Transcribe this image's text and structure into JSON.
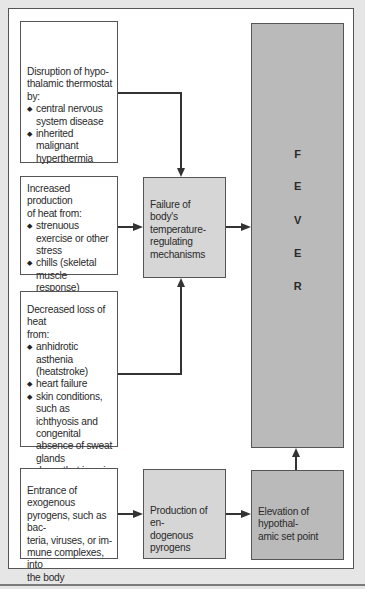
{
  "diagram": {
    "causes": [
      {
        "heading": "Disruption of hypo-thalamic thermostat by:",
        "heading_lines": [
          "Disruption of hypo-",
          "thalamic thermostat by:"
        ],
        "items": [
          "central nervous system disease",
          "inherited malignant hyperthermia"
        ]
      },
      {
        "heading": "Increased production of heat from:",
        "heading_lines": [
          "Increased production",
          "of heat from:"
        ],
        "items": [
          "strenuous exercise or other stress",
          "chills (skeletal muscle response)",
          "thyrotoxicosis"
        ]
      },
      {
        "heading": "Decreased loss of heat from:",
        "heading_lines": [
          "Decreased loss of heat",
          "from:"
        ],
        "items": [
          "anhidrotic asthenia (heatstroke)",
          "heart failure",
          "skin conditions, such as ichthyosis and congenital absence of sweat glands",
          "drugs that impair sweating"
        ]
      }
    ],
    "failure_box": "Failure of body's temperature-regulating mechanisms",
    "failure_lines": [
      "Failure of",
      "body's",
      "temperature-",
      "regulating",
      "mechanisms"
    ],
    "pyrogen_source": "Entrance of exogenous pyrogens, such as bacteria, viruses, or immune complexes, into the body",
    "pyrogen_source_lines": [
      "Entrance of exogenous",
      "pyrogens, such as bac-",
      "teria, viruses, or im-",
      "mune complexes, into",
      "the body"
    ],
    "production_box": "Production of endogenous pyrogens",
    "production_lines": [
      "Production of en-",
      "dogenous pyrogens"
    ],
    "elevation_box": "Elevation of hypothalamic set point",
    "elevation_lines": [
      "Elevation of hypothal-",
      "amic set point"
    ],
    "outcome": "FEVER",
    "outcome_letters": [
      "F",
      "E",
      "V",
      "E",
      "R"
    ]
  },
  "colors": {
    "white_box": "#ffffff",
    "light_box": "#d6d6d6",
    "dark_box": "#bababa",
    "background": "#e6e6e6",
    "line": "#333333"
  }
}
